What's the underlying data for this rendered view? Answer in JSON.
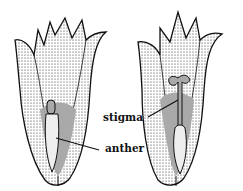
{
  "figure": {
    "left_flower": {
      "name": "flower-left",
      "visible_parts": [
        "anther"
      ]
    },
    "right_flower": {
      "name": "flower-right",
      "visible_parts": [
        "stigma",
        "anther"
      ]
    }
  },
  "labels": {
    "stigma": "stigma",
    "anther": "anther"
  },
  "colors": {
    "ink": "#111111",
    "background": "#ffffff"
  }
}
